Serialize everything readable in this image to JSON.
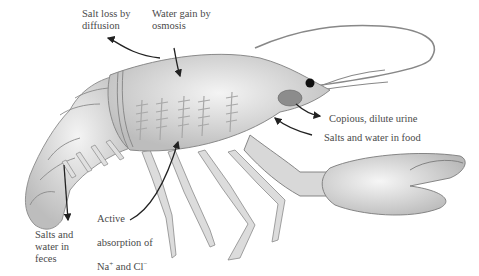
{
  "figure": {
    "colors": {
      "body_fill": "#d9d9d9",
      "body_highlight": "#f2f2f2",
      "outline": "#8a8a8a",
      "text": "#4a4a4a",
      "arrow": "#222222",
      "gill": "#b5b5b5",
      "gland": "#8c8c8c",
      "eye": "#111111"
    }
  },
  "labels": {
    "salt_loss": "Salt loss by\ndiffusion",
    "water_gain": "Water gain by\nosmosis",
    "urine": "Copious, dilute urine",
    "food": "Salts and water in food",
    "active_line1": "Active",
    "active_line2": "absorption of",
    "active_line3_prefix": "Na",
    "active_line3_sup1": "+",
    "active_line3_mid": " and Cl",
    "active_line3_sup2": "−",
    "feces": "Salts and\nwater in\nfeces"
  }
}
